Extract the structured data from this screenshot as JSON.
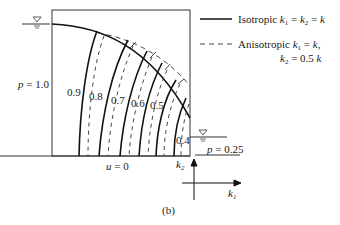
{
  "diagram": {
    "panel_label": "(b)",
    "boundary_labels": {
      "left": "p = 1.0",
      "bottom": "u = 0",
      "right": "p = 0.25"
    },
    "contour_values": [
      "0.9",
      "0.8",
      "0.7",
      "0.6",
      "0.5",
      "0.4"
    ],
    "axes": {
      "vertical": "k2",
      "horizontal": "k1"
    },
    "legend": [
      {
        "style": "solid",
        "label": "Isotropic",
        "math": "k1 = k2 = k"
      },
      {
        "style": "dashed",
        "label": "Anisotropic",
        "math_line1": "k1 = k,",
        "math_line2": "k2 = 0.5 k"
      }
    ],
    "water_level_symbols": [
      "left-reservoir",
      "right-tailwater"
    ],
    "caption": ""
  },
  "colors": {
    "line": "#111111",
    "text": "#222222",
    "background": "#ffffff"
  }
}
